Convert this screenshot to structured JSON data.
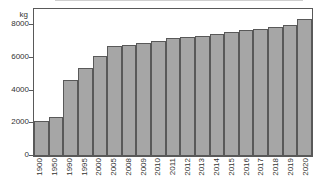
{
  "chart_data": {
    "type": "bar",
    "title": "",
    "unit_label": "kg",
    "categories": [
      "1900",
      "1950",
      "1990",
      "1995",
      "2000",
      "2005",
      "2008",
      "2009",
      "2010",
      "2011",
      "2012",
      "2013",
      "2014",
      "2015",
      "2016",
      "2017",
      "2018",
      "2019",
      "2020"
    ],
    "values": [
      2150,
      2400,
      4650,
      5400,
      6150,
      6750,
      6800,
      6950,
      7050,
      7200,
      7300,
      7350,
      7500,
      7600,
      7700,
      7750,
      7900,
      8050,
      8400
    ],
    "yticks": [
      0,
      2000,
      4000,
      6000,
      8000
    ],
    "ylim": [
      0,
      9000
    ],
    "grid": false,
    "legend_position": "none",
    "colors": {
      "bar_fill": "#a6a6a6",
      "bar_border": "#595959",
      "frame": "#595959",
      "text": "#333333",
      "background": "#ffffff"
    }
  }
}
